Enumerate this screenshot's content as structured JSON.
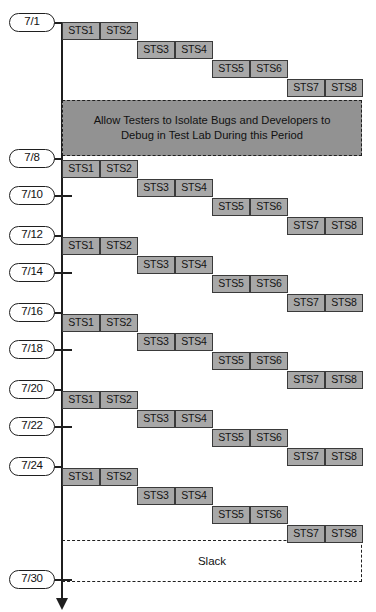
{
  "diagram": {
    "axis": {
      "x": 62,
      "top": 22,
      "bottom": 598,
      "arrow_label": "down-arrow"
    },
    "colors": {
      "task_fill": "#a8a8a8",
      "task_border": "#3a3a3a",
      "callout_fill": "#929292",
      "line": "#1f1f1f",
      "background": "#ffffff"
    },
    "dates": [
      {
        "label": "7/1",
        "y": 13,
        "tick": "stub"
      },
      {
        "label": "7/8",
        "y": 149,
        "tick": "stub"
      },
      {
        "label": "7/10",
        "y": 186,
        "tick": "cross"
      },
      {
        "label": "7/12",
        "y": 226,
        "tick": "stub"
      },
      {
        "label": "7/14",
        "y": 263,
        "tick": "cross"
      },
      {
        "label": "7/16",
        "y": 303,
        "tick": "stub"
      },
      {
        "label": "7/18",
        "y": 340,
        "tick": "cross"
      },
      {
        "label": "7/20",
        "y": 380,
        "tick": "stub"
      },
      {
        "label": "7/22",
        "y": 417,
        "tick": "cross"
      },
      {
        "label": "7/24",
        "y": 457,
        "tick": "stub"
      },
      {
        "label": "7/30",
        "y": 570,
        "tick": "cross"
      }
    ],
    "task_labels": [
      "STS1",
      "STS2",
      "STS3",
      "STS4",
      "STS5",
      "STS6",
      "STS7",
      "STS8"
    ],
    "cycles": [
      {
        "name": "cycle-1",
        "top": 22
      },
      {
        "name": "cycle-2",
        "top": 160
      },
      {
        "name": "cycle-3",
        "top": 237
      },
      {
        "name": "cycle-4",
        "top": 314
      },
      {
        "name": "cycle-5",
        "top": 391
      },
      {
        "name": "cycle-6",
        "top": 468
      }
    ],
    "step": {
      "dx": 75,
      "dy": 19,
      "box_width": 38,
      "box_height": 18,
      "origin_x": 62
    },
    "callout": {
      "line1": "Allow Testers to Isolate Bugs and Developers to",
      "line2": "Debug in Test Lab During this Period",
      "x": 62,
      "y": 100,
      "width": 300,
      "height": 56
    },
    "slack": {
      "label": "Slack",
      "x": 62,
      "y": 540,
      "width": 300,
      "height": 42
    }
  }
}
